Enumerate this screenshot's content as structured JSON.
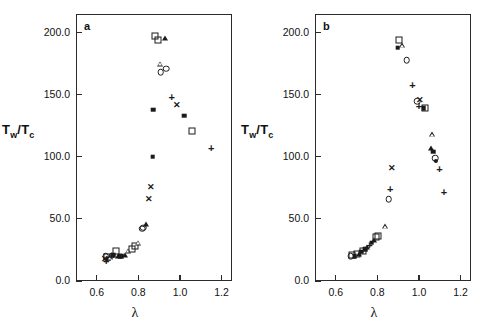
{
  "figure": {
    "background": "#ffffff",
    "ink_color": "#1a1a1a",
    "xlabel": "λ",
    "ylabel_main": "Tw/T",
    "ylabel_num": "T",
    "ylabel_num_sub": "w",
    "ylabel_den": "T",
    "ylabel_den_sub": "c"
  },
  "chart_data": [
    {
      "type": "scatter",
      "panel": "a",
      "title": "a",
      "xlabel": "λ",
      "ylabel": "Tw/Tc",
      "xlim": [
        0.5,
        1.25
      ],
      "ylim": [
        0.0,
        215.0
      ],
      "xticks": [
        0.6,
        0.8,
        1.0,
        1.2
      ],
      "xtick_labels": [
        "0.6",
        "0.8",
        "1.0",
        "1.2"
      ],
      "yticks": [
        0.0,
        50.0,
        100.0,
        150.0,
        200.0
      ],
      "ytick_labels": [
        "0.0",
        "50.0",
        "100.0",
        "150.0",
        "200.0"
      ],
      "grid": false,
      "legend": false,
      "points": [
        {
          "x": 0.638,
          "y": 18.0,
          "marker": "cross"
        },
        {
          "x": 0.642,
          "y": 20.0,
          "marker": "open-circle"
        },
        {
          "x": 0.645,
          "y": 16.5,
          "marker": "plus"
        },
        {
          "x": 0.65,
          "y": 19.5,
          "marker": "open-square"
        },
        {
          "x": 0.655,
          "y": 18.0,
          "marker": "filled-square"
        },
        {
          "x": 0.663,
          "y": 19.0,
          "marker": "open-triangle"
        },
        {
          "x": 0.672,
          "y": 20.5,
          "marker": "open-circle"
        },
        {
          "x": 0.68,
          "y": 21.0,
          "marker": "filled-square"
        },
        {
          "x": 0.69,
          "y": 24.0,
          "marker": "open-square"
        },
        {
          "x": 0.7,
          "y": 20.5,
          "marker": "filled-triangle"
        },
        {
          "x": 0.71,
          "y": 20.0,
          "marker": "filled-square"
        },
        {
          "x": 0.72,
          "y": 20.0,
          "marker": "filled-square"
        },
        {
          "x": 0.735,
          "y": 21.0,
          "marker": "filled-triangle"
        },
        {
          "x": 0.752,
          "y": 24.5,
          "marker": "open-triangle"
        },
        {
          "x": 0.77,
          "y": 26.0,
          "marker": "open-square"
        },
        {
          "x": 0.782,
          "y": 28.0,
          "marker": "open-square"
        },
        {
          "x": 0.8,
          "y": 31.0,
          "marker": "open-triangle"
        },
        {
          "x": 0.818,
          "y": 42.0,
          "marker": "open-circle"
        },
        {
          "x": 0.824,
          "y": 43.0,
          "marker": "open-circle"
        },
        {
          "x": 0.838,
          "y": 46.0,
          "marker": "filled-triangle"
        },
        {
          "x": 0.85,
          "y": 66.0,
          "marker": "cross"
        },
        {
          "x": 0.86,
          "y": 76.0,
          "marker": "cross"
        },
        {
          "x": 0.868,
          "y": 100.0,
          "marker": "filled-square"
        },
        {
          "x": 0.872,
          "y": 138.0,
          "marker": "filled-square"
        },
        {
          "x": 0.88,
          "y": 197.0,
          "marker": "open-square"
        },
        {
          "x": 0.892,
          "y": 194.0,
          "marker": "open-square"
        },
        {
          "x": 0.905,
          "y": 175.0,
          "marker": "open-triangle"
        },
        {
          "x": 0.908,
          "y": 168.0,
          "marker": "open-circle"
        },
        {
          "x": 0.93,
          "y": 196.0,
          "marker": "filled-triangle"
        },
        {
          "x": 0.935,
          "y": 171.0,
          "marker": "open-circle"
        },
        {
          "x": 0.96,
          "y": 148.0,
          "marker": "plus"
        },
        {
          "x": 0.985,
          "y": 142.0,
          "marker": "cross"
        },
        {
          "x": 1.02,
          "y": 133.0,
          "marker": "filled-square"
        },
        {
          "x": 1.06,
          "y": 121.0,
          "marker": "open-square"
        },
        {
          "x": 1.15,
          "y": 107.0,
          "marker": "plus"
        }
      ]
    },
    {
      "type": "scatter",
      "panel": "b",
      "title": "b",
      "xlabel": "λ",
      "ylabel": "Tw/Tc",
      "xlim": [
        0.5,
        1.25
      ],
      "ylim": [
        0.0,
        215.0
      ],
      "xticks": [
        0.6,
        0.8,
        1.0,
        1.2
      ],
      "xtick_labels": [
        "0.6",
        "0.8",
        "1.0",
        "1.2"
      ],
      "yticks": [
        0.0,
        50.0,
        100.0,
        150.0,
        200.0
      ],
      "ytick_labels": [
        "0.0",
        "50.0",
        "100.0",
        "150.0",
        "200.0"
      ],
      "grid": false,
      "legend": false,
      "points": [
        {
          "x": 0.672,
          "y": 20.0,
          "marker": "open-circle"
        },
        {
          "x": 0.68,
          "y": 21.0,
          "marker": "open-square"
        },
        {
          "x": 0.69,
          "y": 20.0,
          "marker": "filled-square"
        },
        {
          "x": 0.7,
          "y": 21.5,
          "marker": "open-square"
        },
        {
          "x": 0.71,
          "y": 22.0,
          "marker": "filled-triangle"
        },
        {
          "x": 0.722,
          "y": 23.5,
          "marker": "filled-square"
        },
        {
          "x": 0.733,
          "y": 24.5,
          "marker": "open-square"
        },
        {
          "x": 0.742,
          "y": 25.5,
          "marker": "filled-square"
        },
        {
          "x": 0.752,
          "y": 27.0,
          "marker": "filled-triangle"
        },
        {
          "x": 0.762,
          "y": 29.0,
          "marker": "plus"
        },
        {
          "x": 0.772,
          "y": 31.0,
          "marker": "filled-square"
        },
        {
          "x": 0.782,
          "y": 33.0,
          "marker": "filled-triangle"
        },
        {
          "x": 0.792,
          "y": 35.5,
          "marker": "open-square"
        },
        {
          "x": 0.802,
          "y": 36.5,
          "marker": "open-square"
        },
        {
          "x": 0.838,
          "y": 44.0,
          "marker": "open-triangle"
        },
        {
          "x": 0.855,
          "y": 66.0,
          "marker": "open-circle"
        },
        {
          "x": 0.862,
          "y": 74.0,
          "marker": "plus"
        },
        {
          "x": 0.872,
          "y": 91.0,
          "marker": "cross"
        },
        {
          "x": 0.898,
          "y": 188.0,
          "marker": "filled-square"
        },
        {
          "x": 0.905,
          "y": 194.0,
          "marker": "open-square"
        },
        {
          "x": 0.918,
          "y": 190.0,
          "marker": "open-triangle"
        },
        {
          "x": 0.94,
          "y": 178.0,
          "marker": "open-circle"
        },
        {
          "x": 0.968,
          "y": 158.0,
          "marker": "plus"
        },
        {
          "x": 0.992,
          "y": 145.0,
          "marker": "open-circle"
        },
        {
          "x": 1.0,
          "y": 141.0,
          "marker": "plus"
        },
        {
          "x": 1.005,
          "y": 146.0,
          "marker": "cross"
        },
        {
          "x": 1.022,
          "y": 139.0,
          "marker": "filled-square"
        },
        {
          "x": 1.03,
          "y": 139.0,
          "marker": "open-square"
        },
        {
          "x": 1.062,
          "y": 118.0,
          "marker": "open-triangle"
        },
        {
          "x": 1.06,
          "y": 107.0,
          "marker": "filled-triangle"
        },
        {
          "x": 1.068,
          "y": 104.0,
          "marker": "filled-square"
        },
        {
          "x": 1.078,
          "y": 99.0,
          "marker": "open-circle"
        },
        {
          "x": 1.082,
          "y": 97.0,
          "marker": "filled-circle"
        },
        {
          "x": 1.098,
          "y": 90.0,
          "marker": "plus"
        },
        {
          "x": 1.12,
          "y": 72.0,
          "marker": "plus"
        }
      ]
    }
  ]
}
